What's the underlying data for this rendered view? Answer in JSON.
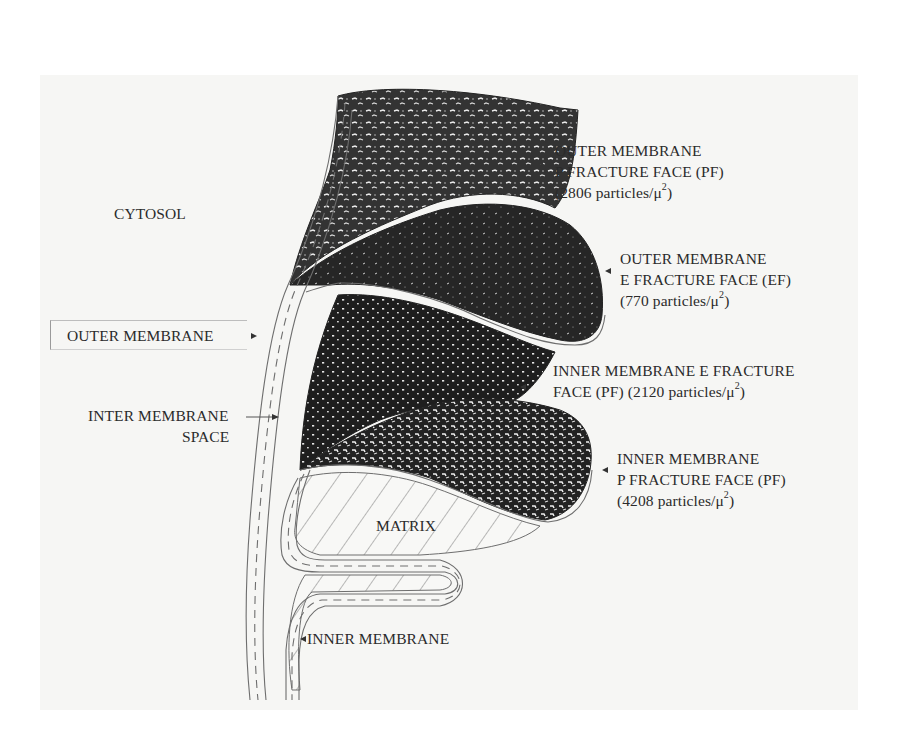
{
  "figure": {
    "colors": {
      "background": "#ffffff",
      "panel": "#f6f6f4",
      "fracture_face_dark": "#2a2a2a",
      "membrane_line": "#6e6e6e",
      "label_text": "#2b2b2b"
    }
  },
  "labels": {
    "cytosol": "CYTOSOL",
    "outer_membrane": "OUTER MEMBRANE",
    "inter_membrane_space": {
      "line1": "INTER MEMBRANE",
      "line2": "SPACE"
    },
    "matrix": "MATRIX",
    "inner_membrane": "INNER MEMBRANE",
    "outer_pf": {
      "line1": "OUTER MEMBRANE",
      "line2": "P FRACTURE FACE (PF)",
      "count": "(2806 particles/μ",
      "exp": "2",
      "close": ")"
    },
    "outer_ef": {
      "line1": "OUTER MEMBRANE",
      "line2": "E FRACTURE FACE (EF)",
      "count": "(770 particles/μ",
      "exp": "2",
      "close": ")"
    },
    "inner_ef": {
      "line1": "INNER MEMBRANE E FRACTURE",
      "line2_prefix": "FACE (PF) (2120 particles/μ",
      "exp": "2",
      "close": ")"
    },
    "inner_pf": {
      "line1": "INNER MEMBRANE",
      "line2": "P FRACTURE FACE (PF)",
      "count": "(4208 particles/μ",
      "exp": "2",
      "close": ")"
    }
  },
  "particle_densities": [
    {
      "face": "Outer membrane P fracture face (PF)",
      "particles_per_um2": 2806
    },
    {
      "face": "Outer membrane E fracture face (EF)",
      "particles_per_um2": 770
    },
    {
      "face": "Inner membrane E fracture face (PF)",
      "particles_per_um2": 2120
    },
    {
      "face": "Inner membrane P fracture face (PF)",
      "particles_per_um2": 4208
    }
  ]
}
